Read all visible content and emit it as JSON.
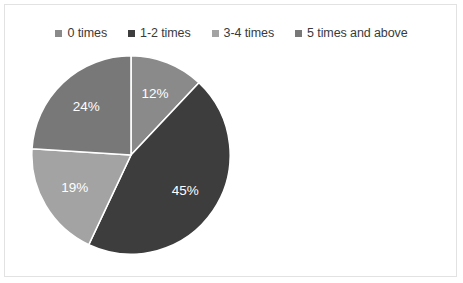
{
  "chart_data": {
    "type": "pie",
    "title": "",
    "categories": [
      "0 times",
      "1-2 times",
      "3-4 times",
      "5 times and above"
    ],
    "values": [
      12,
      45,
      19,
      24
    ],
    "value_labels": [
      "12%",
      "45%",
      "19%",
      "24%"
    ],
    "value_unit": "percent",
    "colors": [
      "#8a8a8a",
      "#3d3d3d",
      "#a3a3a3",
      "#787878"
    ],
    "legend_position": "top",
    "grid": false,
    "start_angle_deg": 0,
    "direction": "clockwise",
    "slice_label_color": "#ffffff",
    "separator_color": "#ffffff",
    "background": "#ffffff",
    "border_color": "#e2e2e2"
  },
  "legend": {
    "items": [
      {
        "label": "0 times",
        "color": "#8a8a8a",
        "marker": "square-swatch"
      },
      {
        "label": "1-2 times",
        "color": "#3d3d3d",
        "marker": "square-swatch"
      },
      {
        "label": "3-4 times",
        "color": "#a3a3a3",
        "marker": "square-swatch"
      },
      {
        "label": "5 times and above",
        "color": "#787878",
        "marker": "square-swatch"
      }
    ]
  },
  "pie": {
    "slices": [
      {
        "label": "0 times",
        "percent_label": "12%",
        "value": 12,
        "color": "#8a8a8a"
      },
      {
        "label": "1-2 times",
        "percent_label": "45%",
        "value": 45,
        "color": "#3d3d3d"
      },
      {
        "label": "3-4 times",
        "percent_label": "19%",
        "value": 19,
        "color": "#a3a3a3"
      },
      {
        "label": "5 times and above",
        "percent_label": "24%",
        "value": 24,
        "color": "#787878"
      }
    ]
  }
}
